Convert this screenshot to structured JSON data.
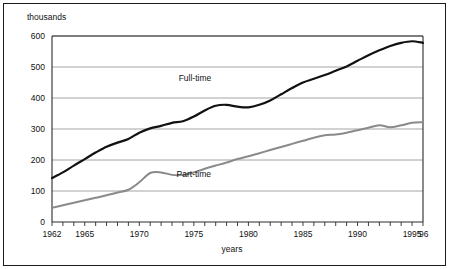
{
  "chart_data": {
    "type": "line",
    "title": "",
    "subtitle": "",
    "xlabel": "years",
    "ylabel": "thousands",
    "unit_label": "thousands",
    "xlim": [
      1962,
      1996
    ],
    "ylim": [
      0,
      600
    ],
    "yticks": [
      0,
      100,
      200,
      300,
      400,
      500,
      600
    ],
    "ytick_labels": [
      "0",
      "100",
      "200",
      "300",
      "400",
      "500",
      "600"
    ],
    "xticks": [
      1962,
      1965,
      1970,
      1975,
      1980,
      1985,
      1990,
      1995,
      1996
    ],
    "xtick_labels": [
      "1962",
      "1965",
      "1970",
      "1975",
      "1980",
      "1985",
      "1990",
      "1995",
      "'96"
    ],
    "grid": true,
    "grid_axis": "y",
    "legend_position": "inline-annotations",
    "x": [
      1962,
      1963,
      1964,
      1965,
      1966,
      1967,
      1968,
      1969,
      1970,
      1971,
      1972,
      1973,
      1974,
      1975,
      1976,
      1977,
      1978,
      1979,
      1980,
      1981,
      1982,
      1983,
      1984,
      1985,
      1986,
      1987,
      1988,
      1989,
      1990,
      1991,
      1992,
      1993,
      1994,
      1995,
      1996
    ],
    "series": [
      {
        "name": "Full-time",
        "color": "#111111",
        "label": "Full-time",
        "values": [
          142,
          160,
          182,
          203,
          224,
          243,
          256,
          268,
          288,
          302,
          310,
          320,
          325,
          340,
          360,
          375,
          378,
          372,
          370,
          378,
          392,
          412,
          432,
          450,
          462,
          474,
          488,
          502,
          520,
          538,
          554,
          568,
          578,
          583,
          578
        ]
      },
      {
        "name": "Part-time",
        "color": "#8a8a8a",
        "label": "Part-time",
        "values": [
          46,
          54,
          62,
          70,
          78,
          86,
          95,
          104,
          128,
          158,
          160,
          152,
          152,
          160,
          172,
          182,
          192,
          203,
          212,
          222,
          232,
          242,
          252,
          262,
          272,
          280,
          282,
          288,
          296,
          304,
          312,
          306,
          312,
          320,
          322
        ]
      }
    ],
    "annotations": [
      {
        "text": "Full-time",
        "x": 1975.1,
        "y": 455
      },
      {
        "text": "Part-time",
        "x": 1975.0,
        "y": 145
      }
    ]
  }
}
